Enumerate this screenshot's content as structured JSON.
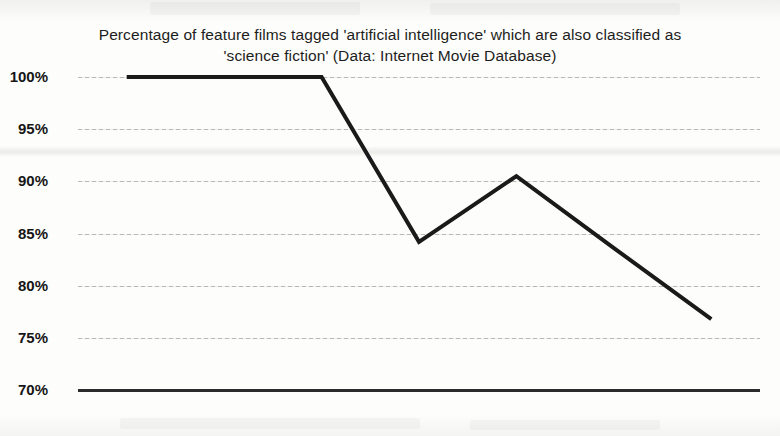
{
  "chart_data": {
    "type": "line",
    "title": "Percentage of feature films tagged 'artificial intelligence' which are also classified as 'science fiction' (Data: Internet Movie Database)",
    "title_lines": [
      "Percentage of feature films tagged 'artificial intelligence' which are also classified as",
      "'science fiction' (Data: Internet Movie Database)"
    ],
    "xlabel": "",
    "ylabel": "",
    "categories": [
      "1949–1958",
      "1959–1968",
      "1969–1978",
      "1979–1988",
      "1989–1998",
      "1999–2008",
      "2009–2018"
    ],
    "values": [
      100,
      100,
      100,
      84.2,
      90.5,
      83.6,
      76.8
    ],
    "series": [
      {
        "name": "Percentage classified as science fiction",
        "values": [
          100,
          100,
          100,
          84.2,
          90.5,
          83.6,
          76.8
        ]
      }
    ],
    "ylim": [
      70,
      100
    ],
    "ytick_values": [
      100,
      95,
      90,
      85,
      80,
      75,
      70
    ],
    "ytick_labels": [
      "100%",
      "95%",
      "90%",
      "85%",
      "80%",
      "75%",
      "70%"
    ],
    "grid": true,
    "legend": false,
    "legend_position": "none",
    "line_color": "#1a1a1a",
    "line_width_px": 4,
    "markers": false,
    "background_color": "#fdfdfb",
    "gridline_color": "#5a5854",
    "axis_color": "#2b2b2b"
  }
}
